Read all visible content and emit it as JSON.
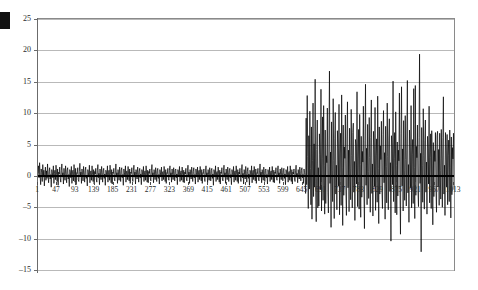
{
  "chart_data": {
    "type": "line",
    "title": "",
    "subtitle": "",
    "xlabel": "",
    "ylabel": "",
    "xlim": [
      1,
      1013
    ],
    "ylim": [
      -15,
      25
    ],
    "grid": true,
    "legend": null,
    "zero_reference_line": 0,
    "y_ticks": [
      25,
      20,
      15,
      10,
      5,
      0,
      -5,
      -10,
      -15
    ],
    "y_tick_labels": [
      "25",
      "20",
      "15",
      "10",
      "5",
      "0",
      "–5",
      "–10",
      "–15"
    ],
    "x_ticks": [
      1,
      47,
      93,
      139,
      185,
      231,
      277,
      323,
      369,
      415,
      461,
      507,
      553,
      599,
      645,
      691,
      737,
      783,
      829,
      875,
      921,
      967,
      1013
    ],
    "x_tick_labels": [
      "1",
      "47",
      "93",
      "139",
      "185",
      "231",
      "277",
      "323",
      "369",
      "415",
      "461",
      "507",
      "553",
      "599",
      "645",
      "691",
      "737",
      "783",
      "829",
      "875",
      "921",
      "967",
      "1013"
    ],
    "x_tick_step": 46,
    "series": [
      {
        "name": "residual-series",
        "color": "#000000",
        "line_width": 0.6,
        "n_points": 1013,
        "regime_change_index": 507,
        "regime_low_volatility_range": [
          -3.2,
          3.4
        ],
        "regime_high_volatility_range": [
          -12.1,
          19.4
        ],
        "max_value": 19.4,
        "min_value": -12.1,
        "values": [
          0.4,
          1.6,
          -0.3,
          2.1,
          0.2,
          -1.4,
          1.1,
          0.6,
          -0.9,
          1.8,
          -0.2,
          0.9,
          -1.6,
          0.3,
          1.4,
          -0.7,
          0.8,
          -0.4,
          1.9,
          0.1,
          -1.1,
          0.7,
          1.3,
          -0.5,
          0.2,
          -1.8,
          1.0,
          0.5,
          -0.3,
          1.6,
          -1.2,
          0.4,
          0.9,
          -0.6,
          1.7,
          0.2,
          -0.9,
          1.1,
          -1.5,
          0.6,
          0.3,
          1.4,
          -0.4,
          -1.0,
          0.8,
          1.9,
          -0.2,
          0.5,
          -1.3,
          1.2,
          0.1,
          -0.7,
          1.6,
          0.4,
          -1.1,
          0.9,
          1.3,
          -0.5,
          0.2,
          -1.7,
          1.0,
          0.6,
          -0.3,
          1.5,
          -1.2,
          0.7,
          0.9,
          -0.8,
          1.8,
          0.3,
          -1.0,
          1.2,
          -1.4,
          0.5,
          0.4,
          1.3,
          -0.6,
          -0.9,
          0.7,
          2.0,
          -0.1,
          0.6,
          -1.2,
          1.1,
          0.2,
          -0.8,
          1.5,
          0.3,
          -1.0,
          0.8,
          1.4,
          -0.4,
          0.1,
          -1.6,
          1.0,
          0.5,
          -0.2,
          1.7,
          -1.1,
          0.6,
          0.8,
          -0.7,
          1.6,
          0.2,
          -0.9,
          1.0,
          -1.3,
          0.7,
          0.3,
          1.2,
          -0.5,
          -1.0,
          0.9,
          1.8,
          -0.3,
          0.4,
          -1.4,
          1.1,
          0.1,
          -0.6,
          1.5,
          0.5,
          -1.0,
          0.8,
          1.2,
          -0.4,
          0.3,
          -1.5,
          0.9,
          0.6,
          -0.2,
          1.6,
          -1.0,
          0.5,
          0.9,
          -0.7,
          1.7,
          0.2,
          -1.1,
          1.0,
          -1.3,
          0.6,
          0.4,
          1.2,
          -0.5,
          -0.8,
          0.8,
          1.9,
          -0.2,
          0.5,
          -1.2,
          1.0,
          0.3,
          -0.7,
          1.4,
          0.4,
          -0.9,
          0.9,
          1.3,
          -0.3,
          0.2,
          -1.5,
          1.1,
          0.5,
          -0.1,
          1.6,
          -1.0,
          0.7,
          0.8,
          -0.6,
          1.5,
          0.3,
          -0.8,
          1.1,
          -1.2,
          0.6,
          0.4,
          1.3,
          -0.4,
          -0.9,
          0.9,
          1.7,
          -0.2,
          0.6,
          -1.3,
          1.0,
          0.2,
          -0.5,
          1.4,
          0.5,
          -1.0,
          0.7,
          1.2,
          -0.3,
          0.3,
          -1.4,
          1.0,
          0.6,
          -0.2,
          1.5,
          -0.9,
          0.5,
          0.8,
          -0.7,
          1.6,
          0.3,
          -1.0,
          0.9,
          -1.1,
          0.7,
          0.4,
          1.1,
          -0.5,
          -0.8,
          0.8,
          1.8,
          -0.1,
          0.5,
          -1.1,
          1.0,
          0.3,
          -0.6,
          1.3,
          0.4,
          -0.9,
          0.8,
          1.2,
          -0.4,
          0.2,
          -1.3,
          1.0,
          0.5,
          -0.2,
          1.4,
          -0.8,
          0.6,
          0.7,
          -0.6,
          1.5,
          0.3,
          -0.9,
          1.0,
          -1.2,
          0.5,
          0.4,
          1.2,
          -0.4,
          -0.7,
          0.9,
          1.6,
          -0.2,
          0.5,
          -1.0,
          1.1,
          0.2,
          -0.6,
          1.3,
          0.4,
          -0.8,
          0.9,
          1.1,
          -0.3,
          0.3,
          -1.4,
          1.0,
          0.6,
          -0.1,
          1.5,
          -0.9,
          0.5,
          0.8,
          -0.7,
          1.4,
          0.2,
          -1.0,
          0.9,
          -1.1,
          0.6,
          0.3,
          1.2,
          -0.5,
          -0.8,
          0.8,
          1.7,
          -0.2,
          0.6,
          -1.2,
          1.0,
          0.3,
          -0.5,
          1.4,
          0.4,
          -0.9,
          0.7,
          1.3,
          -0.3,
          0.2,
          -1.3,
          1.1,
          0.5,
          -0.2,
          1.4,
          -1.0,
          0.6,
          0.9,
          -0.6,
          1.5,
          0.3,
          -0.8,
          1.0,
          -1.2,
          0.5,
          0.4,
          1.1,
          -0.4,
          -0.9,
          0.8,
          1.6,
          -0.1,
          0.5,
          -1.1,
          1.0,
          0.2,
          -0.7,
          1.3,
          0.4,
          -0.8,
          0.9,
          1.2,
          -0.4,
          0.3,
          -1.5,
          1.0,
          0.6,
          -0.2,
          1.6,
          -0.9,
          0.5,
          0.7,
          -0.6,
          1.4,
          0.3,
          -1.0,
          0.9,
          -1.3,
          0.6,
          0.4,
          1.3,
          -0.5,
          -0.8,
          0.9,
          1.7,
          -0.2,
          0.5,
          -1.2,
          1.1,
          0.3,
          -0.6,
          1.4,
          0.5,
          -0.9,
          0.8,
          1.2,
          -0.3,
          0.2,
          -1.4,
          1.0,
          0.5,
          -0.1,
          1.5,
          -1.0,
          0.6,
          0.8,
          -0.7,
          1.6,
          0.2,
          -0.9,
          1.0,
          -1.2,
          0.6,
          0.3,
          1.2,
          -0.4,
          -0.9,
          0.9,
          1.8,
          -0.3,
          0.4,
          -1.3,
          1.0,
          0.2,
          -0.5,
          1.5,
          0.4,
          -1.0,
          0.7,
          1.3,
          -0.4,
          0.3,
          -1.5,
          0.9,
          0.6,
          -0.2,
          1.6,
          -1.1,
          0.5,
          0.9,
          -0.6,
          1.5,
          0.3,
          -0.8,
          1.1,
          -1.2,
          0.5,
          0.4,
          1.2,
          -0.5,
          -0.8,
          0.8,
          1.9,
          -0.2,
          0.6,
          -1.1,
          1.0,
          0.3,
          -0.7,
          1.4,
          0.4,
          -0.9,
          0.9,
          1.1,
          -0.3,
          0.2,
          -1.3,
          1.0,
          0.5,
          -0.2,
          1.4,
          -0.9,
          0.6,
          0.8,
          -0.6,
          1.5,
          0.3,
          -1.0,
          0.9,
          -1.1,
          0.6,
          0.4,
          1.3,
          -0.4,
          -0.7,
          0.9,
          1.6,
          -0.1,
          0.5,
          -1.2,
          1.1,
          0.2,
          -0.6,
          1.3,
          0.5,
          -0.8,
          0.8,
          1.2,
          -0.4,
          0.3,
          -1.4,
          1.0,
          0.6,
          -0.2,
          1.5,
          -1.0,
          0.5,
          0.7,
          -0.7,
          1.6,
          0.2,
          -0.9,
          1.0,
          -1.3,
          0.6,
          0.3,
          1.1,
          -0.5,
          -0.9,
          0.8,
          1.7,
          -0.2,
          0.4,
          -1.1,
          1.0,
          0.3,
          -0.5,
          1.4,
          0.4,
          -0.8,
          0.9,
          1.3,
          -0.3,
          0.2,
          -1.2,
          1.1,
          0.5,
          -0.1,
          -2.8,
          9.2,
          -1.4,
          12.8,
          3.1,
          -5.2,
          6.4,
          -2.1,
          10.3,
          1.2,
          -4.6,
          7.8,
          -6.9,
          2.4,
          11.6,
          -3.3,
          5.1,
          -1.8,
          15.4,
          -2.6,
          -7.3,
          4.2,
          8.9,
          -5.1,
          1.3,
          -4.8,
          6.7,
          3.4,
          -2.2,
          13.8,
          -5.6,
          2.8,
          9.4,
          -3.9,
          11.2,
          1.6,
          -6.1,
          7.3,
          -4.4,
          3.2,
          2.1,
          10.8,
          -2.7,
          -5.9,
          5.4,
          16.7,
          -1.2,
          3.8,
          -8.2,
          8.6,
          0.9,
          -4.1,
          12.3,
          2.4,
          -6.8,
          5.9,
          10.1,
          -2.9,
          1.7,
          -5.4,
          7.2,
          4.3,
          -1.6,
          11.4,
          -6.2,
          3.5,
          6.8,
          -4.7,
          12.9,
          1.4,
          -7.9,
          8.1,
          -3.1,
          4.6,
          2.8,
          9.7,
          -2.4,
          -6.3,
          6.2,
          11.8,
          -1.9,
          4.1,
          -5.7,
          7.6,
          1.1,
          -3.8,
          10.6,
          3.2,
          -5.1,
          6.9,
          8.4,
          -2.6,
          2.3,
          -7.1,
          5.8,
          4.9,
          -1.3,
          13.4,
          -4.9,
          2.7,
          7.4,
          -5.3,
          9.8,
          1.8,
          -6.6,
          6.3,
          -3.4,
          3.9,
          2.2,
          11.1,
          -2.1,
          -8.4,
          5.6,
          14.6,
          -1.5,
          4.4,
          -4.6,
          8.2,
          0.7,
          -3.6,
          9.3,
          2.9,
          -5.8,
          6.1,
          12.1,
          -2.8,
          1.9,
          -6.4,
          7.1,
          4.2,
          -1.7,
          10.9,
          -5.5,
          3.3,
          5.9,
          -4.2,
          12.7,
          1.2,
          -7.6,
          7.8,
          -2.9,
          4.8,
          2.6,
          8.7,
          -2.3,
          -5.2,
          6.6,
          10.4,
          -1.1,
          3.7,
          -6.9,
          7.9,
          1.5,
          -4.3,
          11.6,
          3.1,
          -5.4,
          5.7,
          9.1,
          -2.5,
          2.1,
          -10.4,
          6.4,
          4.6,
          -1.4,
          15.1,
          -4.1,
          2.8,
          6.9,
          -5.9,
          10.2,
          1.7,
          -6.2,
          5.4,
          -3.2,
          4.1,
          2.4,
          13.2,
          -2.2,
          -9.3,
          6.8,
          14.2,
          -1.6,
          4.3,
          -5.6,
          8.8,
          0.8,
          -3.9,
          9.6,
          2.6,
          -4.8,
          6.2,
          15.2,
          -2.7,
          1.8,
          -7.4,
          7.3,
          4.1,
          -1.9,
          11.2,
          -5.1,
          3.4,
          5.8,
          -4.4,
          13.9,
          1.3,
          -6.8,
          14.4,
          -3.1,
          4.7,
          2.9,
          8.1,
          -2.4,
          -4.9,
          6.1,
          19.4,
          -1.2,
          3.6,
          -12.1,
          7.7,
          1.6,
          -4.2,
          10.7,
          3.3,
          -5.3,
          5.6,
          8.9,
          -2.6,
          2.2,
          -6.1,
          6.3,
          4.4,
          -1.3,
          11.1,
          -4.3,
          2.9,
          6.7,
          -5.2,
          7.2,
          1.9,
          -7.8,
          5.3,
          -3.3,
          4.0,
          2.3,
          6.9,
          -2.1,
          -5.8,
          6.4,
          7.1,
          -1.7,
          4.2,
          -4.7,
          6.8,
          0.9,
          -3.7,
          7.4,
          2.7,
          -5.0,
          6.1,
          12.6,
          -2.9,
          1.7,
          -6.3,
          6.9,
          4.0,
          -1.8,
          6.6,
          -4.6,
          3.2,
          5.7,
          -4.1,
          7.3,
          1.4,
          -6.7,
          6.2,
          -3.0,
          4.5,
          2.7,
          6.8,
          -2.2
        ]
      }
    ],
    "axis_color": "#6b6b6b",
    "grid_color": "#b9b9b9"
  },
  "annotations": {
    "corner_marker": "solid-black-block"
  }
}
